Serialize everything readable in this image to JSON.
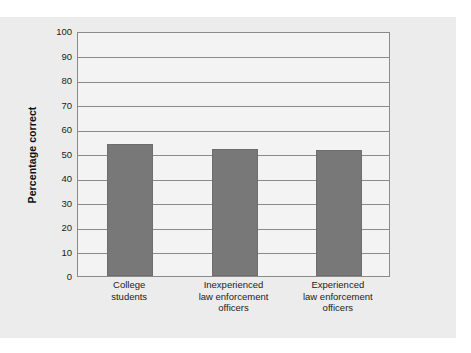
{
  "chart_data": {
    "type": "bar",
    "title": "",
    "subtitle": "",
    "xlabel": "",
    "ylabel": "Percentage correct",
    "ylim": [
      0,
      100
    ],
    "yticks": [
      0,
      10,
      20,
      30,
      40,
      50,
      60,
      70,
      80,
      90,
      100
    ],
    "ytick_labels": [
      "0",
      "10",
      "20",
      "30",
      "40",
      "50",
      "60",
      "70",
      "80",
      "90",
      "100"
    ],
    "grid": true,
    "grid_axis": "y",
    "legend": false,
    "legend_position": "none",
    "categories": [
      "College students",
      "Inexperienced law enforcement officers",
      "Experienced law enforcement officers"
    ],
    "category_label_lines": [
      [
        "College",
        "students"
      ],
      [
        "Inexperienced",
        "law enforcement",
        "officers"
      ],
      [
        "Experienced",
        "law enforcement",
        "officers"
      ]
    ],
    "values": [
      54,
      52,
      51.5
    ],
    "bar_color": "#787878",
    "bar_edge_color": "#6d6d6d",
    "plot_background": "#f3f3f3",
    "panel_background": "#ececed",
    "axis_color": "#8a8a8a",
    "text_color": "#1b1b1b"
  }
}
